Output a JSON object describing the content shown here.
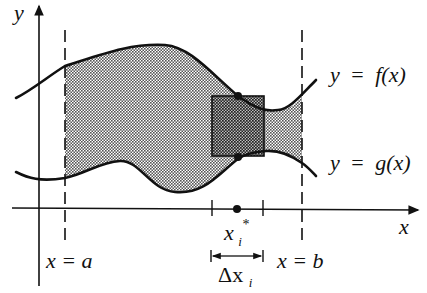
{
  "diagram": {
    "colors": {
      "ink": "#111111",
      "region_fill": "#c8c8c8",
      "rectangle_fill": "#7a7a7a",
      "background": "#ffffff"
    },
    "axes": {
      "x_label": "x",
      "y_label": "y"
    },
    "curves": [
      {
        "name": "upper",
        "label": "y = f(x)",
        "parts": [
          "y",
          "=",
          "f(x)"
        ]
      },
      {
        "name": "lower",
        "label": "y = g(x)",
        "parts": [
          "y",
          "=",
          "g(x)"
        ]
      }
    ],
    "bounds": {
      "left": {
        "label": "x = a"
      },
      "right": {
        "label": "x = b"
      }
    },
    "sample": {
      "point_label": "x",
      "point_sub": "i",
      "point_sup": "*",
      "width_label": "Δx",
      "width_sub": "i"
    }
  }
}
